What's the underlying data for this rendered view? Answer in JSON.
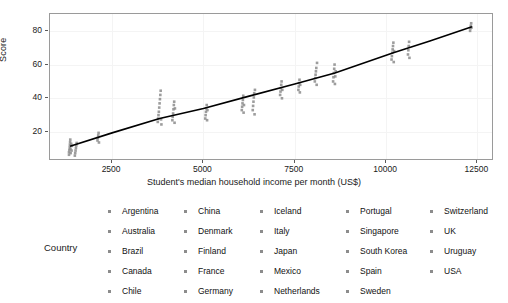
{
  "chart_data": {
    "type": "scatter",
    "title": "",
    "xlabel": "Student's median household income per month (US$)",
    "ylabel": "Score",
    "xlim": [
      800,
      12900
    ],
    "ylim": [
      4,
      90
    ],
    "xticks": [
      2500,
      5000,
      7500,
      10000,
      12500
    ],
    "yticks": [
      20,
      40,
      60,
      80
    ],
    "grid": true,
    "legend_position": "bottom",
    "legend_title": "Country",
    "point_color": "#8c8c8c",
    "line_color": "#000000",
    "panel_border_color": "#9a9a9a",
    "trend_line": {
      "label": "fitted line",
      "points": [
        {
          "x": 1350,
          "y": 11.5
        },
        {
          "x": 2500,
          "y": 19.5
        },
        {
          "x": 3800,
          "y": 28.0
        },
        {
          "x": 5000,
          "y": 34.0
        },
        {
          "x": 6200,
          "y": 41.0
        },
        {
          "x": 7500,
          "y": 48.5
        },
        {
          "x": 8600,
          "y": 55.0
        },
        {
          "x": 10200,
          "y": 67.0
        },
        {
          "x": 11200,
          "y": 74.0
        },
        {
          "x": 12350,
          "y": 82.5
        }
      ]
    },
    "series": [
      {
        "name": "Country scores vs income",
        "points": [
          {
            "x": 1320,
            "y": 6.5
          },
          {
            "x": 1320,
            "y": 8.0
          },
          {
            "x": 1330,
            "y": 9.5
          },
          {
            "x": 1340,
            "y": 11.0
          },
          {
            "x": 1345,
            "y": 12.5
          },
          {
            "x": 1350,
            "y": 14.0
          },
          {
            "x": 1355,
            "y": 15.5
          },
          {
            "x": 1360,
            "y": 10.0
          },
          {
            "x": 1365,
            "y": 7.5
          },
          {
            "x": 1380,
            "y": 13.0
          },
          {
            "x": 1390,
            "y": 9.0
          },
          {
            "x": 1400,
            "y": 11.8
          },
          {
            "x": 1480,
            "y": 6.0
          },
          {
            "x": 1490,
            "y": 7.5
          },
          {
            "x": 1500,
            "y": 9.0
          },
          {
            "x": 1510,
            "y": 10.5
          },
          {
            "x": 1520,
            "y": 12.0
          },
          {
            "x": 1530,
            "y": 13.5
          },
          {
            "x": 2100,
            "y": 15.0
          },
          {
            "x": 2110,
            "y": 16.5
          },
          {
            "x": 2120,
            "y": 18.0
          },
          {
            "x": 2130,
            "y": 19.5
          },
          {
            "x": 2140,
            "y": 13.8
          },
          {
            "x": 3750,
            "y": 26.0
          },
          {
            "x": 3760,
            "y": 28.0
          },
          {
            "x": 3770,
            "y": 30.0
          },
          {
            "x": 3780,
            "y": 32.0
          },
          {
            "x": 3790,
            "y": 34.5
          },
          {
            "x": 3800,
            "y": 37.0
          },
          {
            "x": 3810,
            "y": 39.5
          },
          {
            "x": 3820,
            "y": 42.0
          },
          {
            "x": 3830,
            "y": 44.5
          },
          {
            "x": 3840,
            "y": 27.5
          },
          {
            "x": 3850,
            "y": 24.5
          },
          {
            "x": 4150,
            "y": 27.0
          },
          {
            "x": 4160,
            "y": 29.0
          },
          {
            "x": 4170,
            "y": 31.0
          },
          {
            "x": 4180,
            "y": 33.5
          },
          {
            "x": 4190,
            "y": 36.0
          },
          {
            "x": 4200,
            "y": 38.0
          },
          {
            "x": 4210,
            "y": 25.5
          },
          {
            "x": 4220,
            "y": 34.0
          },
          {
            "x": 5050,
            "y": 28.0
          },
          {
            "x": 5060,
            "y": 30.0
          },
          {
            "x": 5070,
            "y": 32.0
          },
          {
            "x": 5080,
            "y": 34.0
          },
          {
            "x": 5090,
            "y": 36.0
          },
          {
            "x": 5100,
            "y": 27.0
          },
          {
            "x": 5110,
            "y": 33.0
          },
          {
            "x": 6050,
            "y": 33.0
          },
          {
            "x": 6060,
            "y": 35.0
          },
          {
            "x": 6070,
            "y": 37.0
          },
          {
            "x": 6080,
            "y": 39.0
          },
          {
            "x": 6090,
            "y": 41.5
          },
          {
            "x": 6100,
            "y": 31.5
          },
          {
            "x": 6110,
            "y": 36.0
          },
          {
            "x": 6350,
            "y": 33.0
          },
          {
            "x": 6360,
            "y": 35.5
          },
          {
            "x": 6370,
            "y": 38.0
          },
          {
            "x": 6380,
            "y": 40.5
          },
          {
            "x": 6390,
            "y": 43.0
          },
          {
            "x": 6400,
            "y": 30.5
          },
          {
            "x": 6410,
            "y": 45.0
          },
          {
            "x": 7100,
            "y": 42.0
          },
          {
            "x": 7110,
            "y": 44.0
          },
          {
            "x": 7120,
            "y": 46.0
          },
          {
            "x": 7130,
            "y": 48.0
          },
          {
            "x": 7140,
            "y": 50.0
          },
          {
            "x": 7150,
            "y": 40.0
          },
          {
            "x": 7160,
            "y": 45.0
          },
          {
            "x": 7600,
            "y": 45.0
          },
          {
            "x": 7610,
            "y": 47.0
          },
          {
            "x": 7620,
            "y": 49.0
          },
          {
            "x": 7630,
            "y": 51.0
          },
          {
            "x": 7640,
            "y": 43.5
          },
          {
            "x": 7650,
            "y": 48.0
          },
          {
            "x": 8050,
            "y": 50.0
          },
          {
            "x": 8060,
            "y": 52.0
          },
          {
            "x": 8070,
            "y": 54.0
          },
          {
            "x": 8080,
            "y": 56.0
          },
          {
            "x": 8090,
            "y": 58.0
          },
          {
            "x": 8100,
            "y": 48.0
          },
          {
            "x": 8110,
            "y": 61.0
          },
          {
            "x": 8550,
            "y": 50.0
          },
          {
            "x": 8560,
            "y": 52.5
          },
          {
            "x": 8570,
            "y": 55.0
          },
          {
            "x": 8580,
            "y": 57.5
          },
          {
            "x": 8590,
            "y": 60.0
          },
          {
            "x": 8600,
            "y": 48.5
          },
          {
            "x": 8610,
            "y": 53.0
          },
          {
            "x": 8620,
            "y": 56.0
          },
          {
            "x": 10150,
            "y": 63.0
          },
          {
            "x": 10160,
            "y": 65.0
          },
          {
            "x": 10170,
            "y": 67.0
          },
          {
            "x": 10180,
            "y": 69.0
          },
          {
            "x": 10190,
            "y": 71.0
          },
          {
            "x": 10200,
            "y": 73.0
          },
          {
            "x": 10210,
            "y": 61.5
          },
          {
            "x": 10220,
            "y": 68.0
          },
          {
            "x": 10600,
            "y": 66.0
          },
          {
            "x": 10610,
            "y": 68.5
          },
          {
            "x": 10620,
            "y": 71.0
          },
          {
            "x": 10630,
            "y": 73.5
          },
          {
            "x": 10640,
            "y": 64.0
          },
          {
            "x": 12300,
            "y": 80.0
          },
          {
            "x": 12310,
            "y": 81.5
          },
          {
            "x": 12320,
            "y": 83.0
          },
          {
            "x": 12330,
            "y": 84.5
          },
          {
            "x": 12340,
            "y": 82.0
          }
        ]
      }
    ]
  },
  "axis": {
    "y_title": "Score",
    "x_title": "Student's median household income per month (US$)",
    "y_tick_labels": [
      "80",
      "60",
      "40",
      "20"
    ],
    "x_tick_labels": [
      "2500",
      "5000",
      "7500",
      "10000",
      "12500"
    ]
  },
  "legend": {
    "title": "Country",
    "columns": [
      {
        "items": [
          "Argentina",
          "Australia",
          "Brazil",
          "Canada",
          "Chile"
        ]
      },
      {
        "items": [
          "China",
          "Denmark",
          "Finland",
          "France",
          "Germany"
        ]
      },
      {
        "items": [
          "Iceland",
          "Italy",
          "Japan",
          "Mexico",
          "Netherlands"
        ]
      },
      {
        "items": [
          "Portugal",
          "Singapore",
          "South Korea",
          "Spain",
          "Sweden"
        ]
      },
      {
        "items": [
          "Switzerland",
          "UK",
          "Uruguay",
          "USA"
        ]
      }
    ]
  }
}
